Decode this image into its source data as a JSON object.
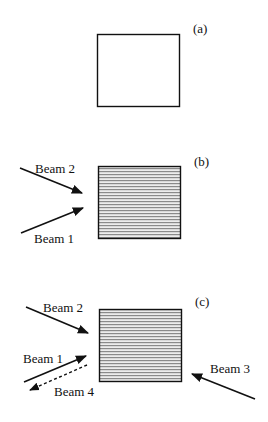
{
  "panels": [
    {
      "id": "a",
      "label": "(a)",
      "state": "empty"
    },
    {
      "id": "b",
      "label": "(b)",
      "state": "grating",
      "beams": [
        "Beam 2",
        "Beam 1"
      ]
    },
    {
      "id": "c",
      "label": "(c)",
      "state": "grating",
      "beams": [
        "Beam 2",
        "Beam 1",
        "Beam 4",
        "Beam 3"
      ]
    }
  ],
  "colors": {
    "line": "#111111",
    "stripe": "#8a8a8a",
    "fill": "#e6e6e6"
  }
}
